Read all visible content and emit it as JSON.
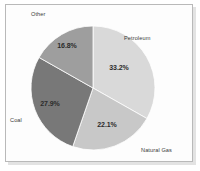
{
  "chart_data": {
    "type": "pie",
    "title": "",
    "subtitle": "",
    "xlabel": "",
    "ylabel": "",
    "legend_position": "none",
    "grid": false,
    "start_angle_deg": 0,
    "direction": "clockwise",
    "categories": [
      "Petroleum",
      "Natural Gas",
      "Coal",
      "Other"
    ],
    "values": [
      33.2,
      22.1,
      27.9,
      16.8
    ],
    "value_unit": "%",
    "slices": [
      {
        "label": "Petroleum",
        "value": 33.2,
        "value_label": "33.2%",
        "color": "#d9d9d9",
        "start_deg": 0.0,
        "end_deg": 119.52,
        "label_x": 124,
        "label_y": 35,
        "pct_x": 119,
        "pct_y": 67
      },
      {
        "label": "Natural Gas",
        "value": 22.1,
        "value_label": "22.1%",
        "color": "#c8c8c8",
        "start_deg": 119.52,
        "end_deg": 199.08,
        "label_x": 141,
        "label_y": 147,
        "pct_x": 107,
        "pct_y": 124
      },
      {
        "label": "Coal",
        "value": 27.9,
        "value_label": "27.9%",
        "color": "#787878",
        "start_deg": 199.08,
        "end_deg": 299.52,
        "label_x": 10,
        "label_y": 117,
        "pct_x": 50,
        "pct_y": 103
      },
      {
        "label": "Other",
        "value": 16.8,
        "value_label": "16.8%",
        "color": "#9e9e9e",
        "start_deg": 299.52,
        "end_deg": 360.0,
        "label_x": 31,
        "label_y": 11,
        "pct_x": 67,
        "pct_y": 45
      }
    ],
    "geometry": {
      "center_x": 93,
      "center_y": 88,
      "radius": 62
    },
    "colors": {
      "petroleum": "#d9d9d9",
      "natural_gas": "#c8c8c8",
      "coal": "#787878",
      "other": "#9e9e9e",
      "slice_edge": "#ffffff",
      "frame_border": "#b9b9b9",
      "plot_background": "#fdfdfd",
      "label_text": "#3a3a3a",
      "percent_text": "#2b2b2b"
    }
  }
}
